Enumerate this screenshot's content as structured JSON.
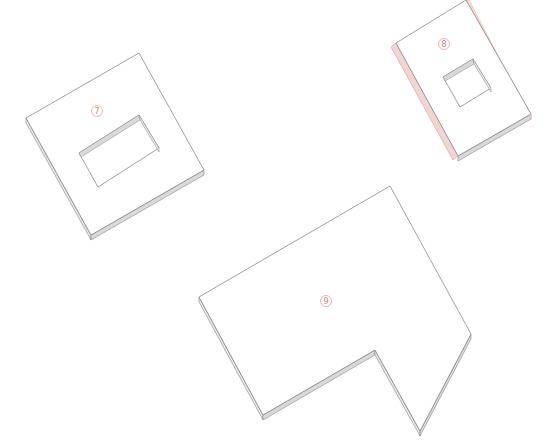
{
  "diagram": {
    "type": "isometric-panel-layout",
    "background": "#ffffff",
    "colors": {
      "outline": "#7a7a7a",
      "top_face": "#ffffff",
      "side_face": "#d9d9d9",
      "side_face_highlight": "#f2d4d0",
      "side_outline_highlight": "#e3a59c",
      "label": "#e07a6e"
    },
    "panels": [
      {
        "id": "7",
        "label": "⑦",
        "label_pos": [
          97,
          111
        ],
        "outline": [
          [
            26,
            118
          ],
          [
            139,
            53
          ],
          [
            204,
            170
          ],
          [
            91,
            235
          ]
        ],
        "hole": [
          [
            79,
            153
          ],
          [
            139,
            115
          ],
          [
            159,
            148
          ],
          [
            98,
            187
          ]
        ],
        "has_hole": true,
        "highlight_edge": false
      },
      {
        "id": "8",
        "label": "⑧",
        "label_pos": [
          444,
          44
        ],
        "outline": [
          [
            396,
            43
          ],
          [
            466,
            0
          ],
          [
            531,
            114
          ],
          [
            458,
            156
          ]
        ],
        "hole": [
          [
            443,
            77
          ],
          [
            473,
            59
          ],
          [
            491,
            88
          ],
          [
            460,
            107
          ]
        ],
        "has_hole": true,
        "highlight_edge": true
      },
      {
        "id": "9",
        "label": "⑨",
        "label_pos": [
          326,
          301
        ],
        "outline": [
          [
            199,
            297
          ],
          [
            390,
            186
          ],
          [
            471,
            334
          ],
          [
            420,
            431
          ],
          [
            375,
            350
          ],
          [
            263,
            415
          ]
        ],
        "has_hole": false,
        "highlight_edge": false
      }
    ]
  }
}
